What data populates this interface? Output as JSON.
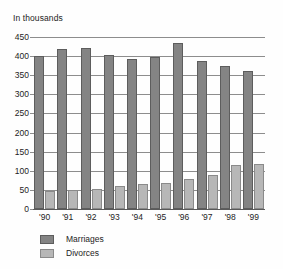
{
  "chart_data": {
    "type": "bar",
    "title": "In thousands",
    "subtitle": "",
    "xlabel": "",
    "ylabel": "",
    "categories": [
      "'90",
      "'91",
      "'92",
      "'93",
      "'94",
      "'95",
      "'96",
      "'97",
      "'98",
      "'99"
    ],
    "series": [
      {
        "name": "Marriages",
        "color": "#848484",
        "values": [
          400,
          418,
          420,
          403,
          393,
          398,
          435,
          388,
          374,
          360
        ]
      },
      {
        "name": "Divorces",
        "color": "#b7b7b7",
        "values": [
          47,
          49,
          53,
          59,
          65,
          68,
          79,
          90,
          115,
          117
        ]
      }
    ],
    "ylim": [
      0,
      450
    ],
    "ytick_labels": [
      "0",
      "50",
      "100",
      "150",
      "200",
      "250",
      "300",
      "350",
      "400",
      "450"
    ],
    "ytick_values": [
      0,
      50,
      100,
      150,
      200,
      250,
      300,
      350,
      400,
      450
    ],
    "grid": true,
    "grid_axis": "y",
    "legend_position": "bottom-left",
    "legend": [
      "Marriages",
      "Divorces"
    ]
  },
  "colors": {
    "background": "#fefefe",
    "text": "#1d1d1d",
    "gridline": "#8d8d8d",
    "axis": "#5a5a5a",
    "marriages": "#848484",
    "divorces": "#b7b7b7"
  }
}
